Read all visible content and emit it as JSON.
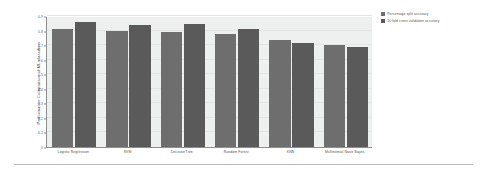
{
  "chart_data": {
    "type": "bar",
    "title": "",
    "xlabel": "",
    "ylabel": "Performance Comparison of ML classifiers",
    "ylim": [
      0,
      0.9
    ],
    "grid": true,
    "legend_position": "right",
    "categories": [
      "Logistic Regression",
      "SVM",
      "Decision Tree",
      "Random Forest",
      "KNN",
      "Multinomial Naive Bayes"
    ],
    "ytick_labels": [
      "0",
      "0.1",
      "0.2",
      "0.3",
      "0.4",
      "0.5",
      "0.6",
      "0.7",
      "0.8",
      "0.9"
    ],
    "ytick_values": [
      0,
      0.1,
      0.2,
      0.3,
      0.4,
      0.5,
      0.6,
      0.7,
      0.8,
      0.9
    ],
    "series": [
      {
        "name": "Percentage split accuracy",
        "color": "#6e6e6e",
        "values": [
          0.81,
          0.8,
          0.79,
          0.775,
          0.735,
          0.7
        ]
      },
      {
        "name": "10 fold cross validation accuracy",
        "color": "#5a5a5a",
        "values": [
          0.86,
          0.84,
          0.845,
          0.81,
          0.715,
          0.69
        ]
      }
    ]
  },
  "legend": {
    "entries": [
      "Percentage split accuracy",
      "10 fold cross validation accuracy"
    ]
  }
}
